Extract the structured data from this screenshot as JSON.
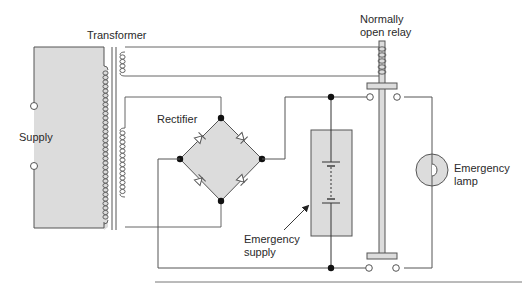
{
  "diagram": {
    "type": "circuit-schematic",
    "labels": {
      "transformer": "Transformer",
      "relay": [
        "Normally",
        "open relay"
      ],
      "supply": "Supply",
      "rectifier": "Rectifier",
      "emergency_supply": [
        "Emergency",
        "supply"
      ],
      "emergency_lamp": [
        "Emergency",
        "lamp"
      ]
    },
    "components": [
      {
        "id": "supply",
        "kind": "ac-source",
        "terminals": 2
      },
      {
        "id": "transformer",
        "kind": "transformer",
        "secondaries": 2
      },
      {
        "id": "rectifier",
        "kind": "bridge-rectifier",
        "diodes": 4
      },
      {
        "id": "emergency_supply",
        "kind": "battery"
      },
      {
        "id": "relay",
        "kind": "normally-open-relay",
        "contacts": 2
      },
      {
        "id": "emergency_lamp",
        "kind": "lamp"
      }
    ],
    "colors": {
      "fill": "#d9d9d9",
      "stroke": "#555555",
      "dot": "#111111",
      "background": "#ffffff"
    }
  }
}
